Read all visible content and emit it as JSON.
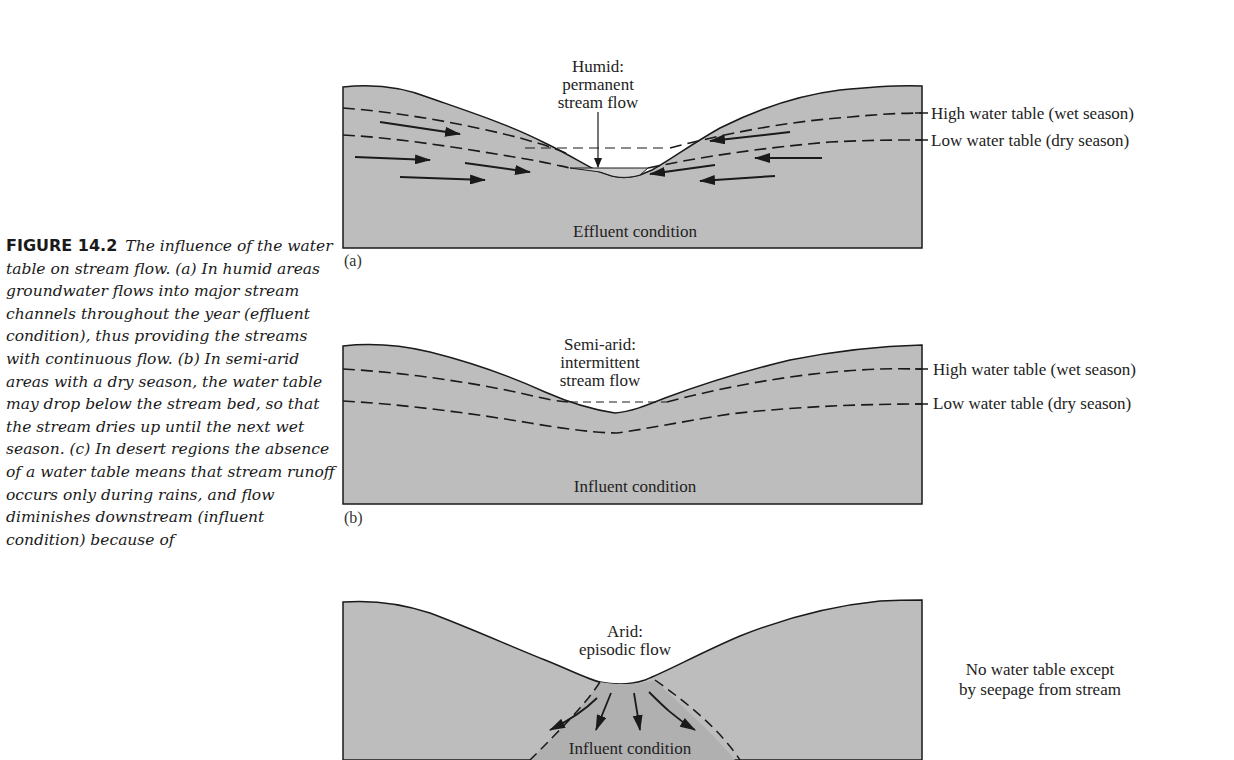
{
  "caption": {
    "figure_label": "FIGURE 14.2",
    "text": "The influence of the water table on stream flow. (a) In humid areas groundwater flows into major stream channels throughout the year (effluent condition), thus providing the streams with continuous flow. (b) In semi-arid areas with a dry season, the water table may drop below the stream bed, so that the stream dries up until the next wet season. (c) In desert regions the absence of a water table means that stream runoff occurs only during rains, and flow diminishes downstream (influent condition) because of"
  },
  "panels": [
    {
      "letter": "(a)",
      "title_lines": [
        "Humid:",
        "permanent",
        "stream flow"
      ],
      "condition": "Effluent condition",
      "side_labels": [
        "High water table (wet season)",
        "Low water table (dry season)"
      ]
    },
    {
      "letter": "(b)",
      "title_lines": [
        "Semi-arid:",
        "intermittent",
        "stream flow"
      ],
      "condition": "Influent condition",
      "side_labels": [
        "High water table (wet season)",
        "Low water table (dry season)"
      ]
    },
    {
      "letter": "(c)",
      "title_lines": [
        "Arid:",
        "episodic flow"
      ],
      "condition": "Influent condition",
      "side_labels": [
        "No water table except",
        "by seepage from stream"
      ]
    }
  ],
  "colors": {
    "ground": "#bdbdbd",
    "ground_dark": "#a9a9a9",
    "outline": "#1a1a1a",
    "background": "#ffffff"
  }
}
